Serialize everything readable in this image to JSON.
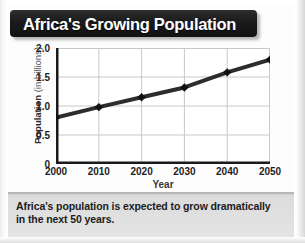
{
  "banner": {
    "title": "Africa's Growing Population"
  },
  "caption": {
    "text": "Africa's population is expected to grow dramatically in the next 50 years."
  },
  "axes": {
    "y_title_strong": "Population",
    "y_title_light": " (in billions)",
    "x_title": "Year"
  },
  "colors": {
    "banner_bg": "#161616",
    "banner_text": "#ffffff",
    "plot_bg": "#ffffff",
    "grid": "#c8c8c8",
    "axis": "#1a1a1a",
    "series_line": "#1b1b1b",
    "marker": "#111111",
    "caption_bg": "#e2e2e2",
    "caption_text": "#1c1c1c"
  },
  "chart_data": {
    "type": "line",
    "title": "Africa's Growing Population",
    "xlabel": "Year",
    "ylabel": "Population (in billions)",
    "x": [
      2000,
      2010,
      2020,
      2030,
      2040,
      2050
    ],
    "xtick_labels": [
      "2000",
      "2010",
      "2020",
      "2030",
      "2040",
      "2050"
    ],
    "ytick_labels": [
      "0",
      "0.5",
      "1.0",
      "1.5",
      "2.0"
    ],
    "ytick_values": [
      0,
      0.5,
      1.0,
      1.5,
      2.0
    ],
    "xlim": [
      2000,
      2050
    ],
    "ylim": [
      0,
      2.0
    ],
    "grid": true,
    "legend": false,
    "series": [
      {
        "name": "Population",
        "values": [
          0.8,
          0.98,
          1.15,
          1.32,
          1.58,
          1.8
        ],
        "marker": "diamond",
        "line_width": 4
      }
    ]
  }
}
